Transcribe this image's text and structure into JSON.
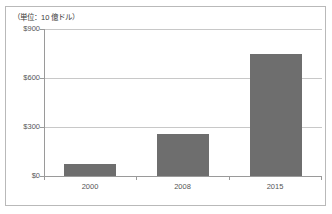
{
  "figure": {
    "unit_caption": "（単位：10 億ドル）",
    "bar_color": "#6e6e6e",
    "gridline_color": "#c8c8c8",
    "axis_color": "#9a9a9a",
    "frame_color": "#b9b9b9",
    "background": "#ffffff"
  },
  "chart_data": {
    "type": "bar",
    "title": "",
    "subtitle": "",
    "xlabel": "",
    "ylabel": "（単位：10 億ドル）",
    "categories": [
      "2000",
      "2008",
      "2015"
    ],
    "values": [
      75,
      255,
      750
    ],
    "series": [
      {
        "name": "",
        "values": [
          75,
          255,
          750
        ]
      }
    ],
    "ylim": [
      0,
      900
    ],
    "yticks": [
      0,
      300,
      600,
      900
    ],
    "ytick_labels": [
      "$0",
      "$300",
      "$600",
      "$900"
    ],
    "xtick_labels": [
      "2000",
      "2008",
      "2015"
    ],
    "grid": true,
    "grid_axis": "y",
    "legend": false,
    "legend_position": "none",
    "annotations": []
  }
}
